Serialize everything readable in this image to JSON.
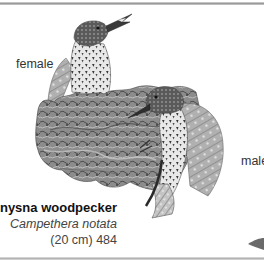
{
  "page": {
    "labels": {
      "female": "female",
      "male": "male"
    },
    "caption": {
      "common_name": "Knysna woodpecker",
      "scientific_name": "Campethera notata",
      "size_and_number": "(20 cm) 484"
    },
    "illustration": {
      "subject": "Knysna woodpecker pair on tree stump",
      "palette": [
        "#ffffff",
        "#d9d9d9",
        "#a6a6a6",
        "#6e6e6e",
        "#3a3a3a",
        "#1a1a1a"
      ]
    }
  }
}
